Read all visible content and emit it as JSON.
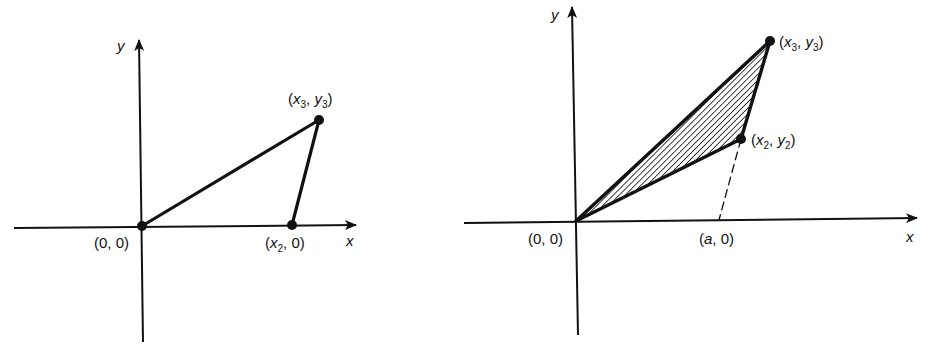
{
  "figure": {
    "left_panel": {
      "axes": {
        "x_label": "x",
        "y_label": "y"
      },
      "points": [
        {
          "name": "origin",
          "label": "(0, 0)"
        },
        {
          "name": "p2",
          "label_prefix": "(",
          "var": "x",
          "sub": "2",
          "label_suffix": ", 0)"
        },
        {
          "name": "p3",
          "label_prefix": "(",
          "var": "x",
          "sub": "3",
          "sep": ", ",
          "var2": "y",
          "sub2": "3",
          "label_suffix": ")"
        }
      ],
      "shape": "triangle with vertices (0,0), (x2,0), (x3,y3)",
      "filled": false
    },
    "right_panel": {
      "axes": {
        "x_label": "x",
        "y_label": "y"
      },
      "points": [
        {
          "name": "origin",
          "label": "(0, 0)"
        },
        {
          "name": "p2",
          "label_prefix": "(",
          "var": "x",
          "sub": "2",
          "sep": ", ",
          "var2": "y",
          "sub2": "2",
          "label_suffix": ")"
        },
        {
          "name": "p3",
          "label_prefix": "(",
          "var": "x",
          "sub": "3",
          "sep": ", ",
          "var2": "y",
          "sub2": "3",
          "label_suffix": ")"
        },
        {
          "name": "a_point",
          "label_prefix": "(",
          "var": "a",
          "label_suffix": ", 0)"
        }
      ],
      "shape": "hatched triangle with vertices (0,0), (x2,y2), (x3,y3); dashed line from (x2,y2) to (a,0)",
      "filled": true,
      "fill_style": "diagonal hatching"
    },
    "colors": {
      "ink": "#111111",
      "background": "#ffffff"
    }
  }
}
